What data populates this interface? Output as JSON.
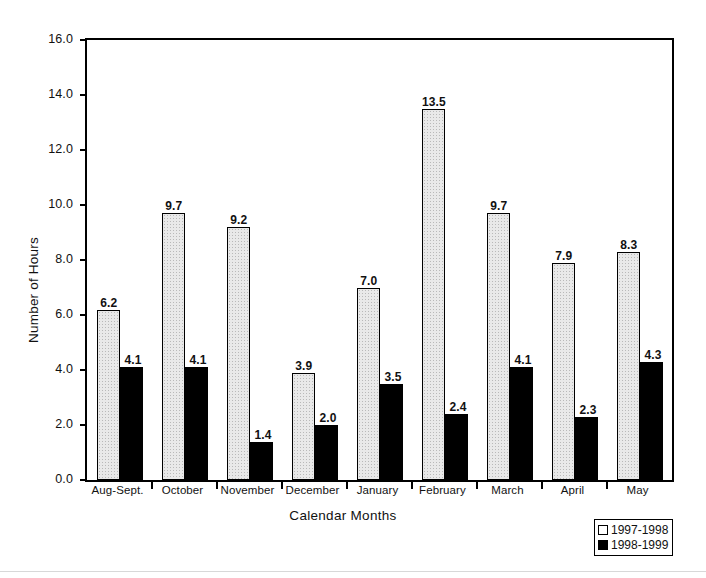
{
  "chart_data": {
    "type": "bar",
    "title": "",
    "xlabel": "Calendar Months",
    "ylabel": "Number of Hours",
    "ylim": [
      0.0,
      16.0
    ],
    "ytick_step": 2.0,
    "yticks": [
      "16.0",
      "14.0",
      "12.0",
      "10.0",
      "8.0",
      "6.0",
      "4.0",
      "2.0",
      "0.0"
    ],
    "grid": false,
    "legend_position": "bottom-right",
    "categories": [
      "Aug-Sept.",
      "October",
      "November",
      "December",
      "January",
      "February",
      "March",
      "April",
      "May"
    ],
    "series": [
      {
        "name": "1997-1998",
        "color": "#e9e9e9",
        "values": [
          6.2,
          9.7,
          9.2,
          3.9,
          7.0,
          13.5,
          9.7,
          7.9,
          8.3
        ],
        "labels": [
          "6.2",
          "9.7",
          "9.2",
          "3.9",
          "7.0",
          "13.5",
          "9.7",
          "7.9",
          "8.3"
        ]
      },
      {
        "name": "1998-1999",
        "color": "#000000",
        "values": [
          4.1,
          4.1,
          1.4,
          2.0,
          3.5,
          2.4,
          4.1,
          2.3,
          4.3
        ],
        "labels": [
          "4.1",
          "4.1",
          "1.4",
          "2.0",
          "3.5",
          "2.4",
          "4.1",
          "2.3",
          "4.3"
        ]
      }
    ]
  },
  "legend": {
    "items": [
      {
        "label": "1997-1998",
        "swatch": "light-square-icon"
      },
      {
        "label": "1998-1999",
        "swatch": "black-square-icon"
      }
    ]
  }
}
